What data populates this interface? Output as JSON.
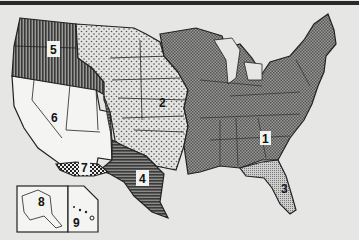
{
  "map": {
    "type": "thematic-region-map",
    "subject": "United States divided into numbered regions",
    "colors": {
      "background": "#e6e6e4",
      "border": "#222222",
      "region_1_fill": "#7a7a7a",
      "region_2_fill": "#d8d8d6",
      "region_3_fill": "#b5b5b3",
      "region_4_fill": "#5a5a5a",
      "region_5_fill": "#6a6a6a",
      "region_6_fill": "#f4f4f2",
      "region_7_fill": "#3a3a3a",
      "region_8_fill": "#f4f4f2",
      "region_9_fill": "#f4f4f2"
    },
    "regions": [
      {
        "id": "1",
        "label": "1",
        "pattern": "dark crosshatch",
        "area": "Eastern and Midwestern states"
      },
      {
        "id": "2",
        "label": "2",
        "pattern": "light dotted",
        "area": "Great Plains / Central states"
      },
      {
        "id": "3",
        "label": "3",
        "pattern": "fine dotted",
        "area": "Florida"
      },
      {
        "id": "4",
        "label": "4",
        "pattern": "dark horizontal lines",
        "area": "Texas and eastern New Mexico"
      },
      {
        "id": "5",
        "label": "5",
        "pattern": "dark vertical lines",
        "area": "Pacific Northwest"
      },
      {
        "id": "6",
        "label": "6",
        "pattern": "plain white",
        "area": "Far West / Southwest"
      },
      {
        "id": "7",
        "label": "7",
        "pattern": "dark checkered",
        "area": "Southern border strip"
      },
      {
        "id": "8",
        "label": "8",
        "pattern": "plain white",
        "area": "Alaska inset"
      },
      {
        "id": "9",
        "label": "9",
        "pattern": "plain white",
        "area": "Hawaii inset"
      }
    ],
    "insets": [
      {
        "name": "alaska-inset",
        "label": "8"
      },
      {
        "name": "hawaii-inset",
        "label": "9"
      }
    ]
  }
}
